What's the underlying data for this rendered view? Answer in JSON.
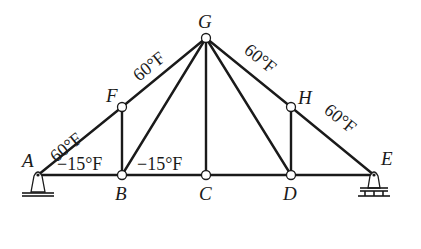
{
  "diagram": {
    "type": "truss",
    "nodes": [
      {
        "id": "A",
        "label": "A",
        "x": 38,
        "y": 175
      },
      {
        "id": "B",
        "label": "B",
        "x": 122,
        "y": 175
      },
      {
        "id": "C",
        "label": "C",
        "x": 206,
        "y": 175
      },
      {
        "id": "D",
        "label": "D",
        "x": 291,
        "y": 175
      },
      {
        "id": "E",
        "label": "E",
        "x": 374,
        "y": 175
      },
      {
        "id": "F",
        "label": "F",
        "x": 122,
        "y": 107
      },
      {
        "id": "G",
        "label": "G",
        "x": 206,
        "y": 38
      },
      {
        "id": "H",
        "label": "H",
        "x": 291,
        "y": 107
      }
    ],
    "members": [
      {
        "from": "A",
        "to": "F"
      },
      {
        "from": "F",
        "to": "G"
      },
      {
        "from": "G",
        "to": "H"
      },
      {
        "from": "H",
        "to": "E"
      },
      {
        "from": "A",
        "to": "B"
      },
      {
        "from": "B",
        "to": "C"
      },
      {
        "from": "C",
        "to": "D"
      },
      {
        "from": "D",
        "to": "E"
      },
      {
        "from": "F",
        "to": "B"
      },
      {
        "from": "B",
        "to": "G"
      },
      {
        "from": "G",
        "to": "C"
      },
      {
        "from": "G",
        "to": "D"
      },
      {
        "from": "H",
        "to": "D"
      }
    ],
    "temperature_labels": {
      "AF": "60°F",
      "FG": "60°F",
      "GH": "60°F",
      "HE": "60°F",
      "AB": "−15°F",
      "BC": "−15°F"
    },
    "supports": {
      "A": "pin",
      "E": "roller"
    }
  }
}
